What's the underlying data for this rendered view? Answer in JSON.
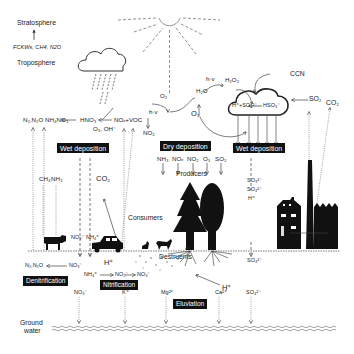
{
  "diagram": {
    "layers": {
      "stratosphere": "Stratosphere",
      "troposphere": "Troposphere",
      "ground_water": [
        "Ground",
        "water"
      ]
    },
    "gases_to_stratosphere": "FCKWs, CH4, N2O",
    "process_boxes": {
      "wet_deposition_left": "Wet deposition",
      "dry_deposition": "Dry deposition",
      "wet_deposition_right": "Wet deposition",
      "denitrification": "Denitrification",
      "nitrification": "Nitrification",
      "eluviation": "Eluviation"
    },
    "atmosphere_left": {
      "n2_n2o": "N₂,N₂O",
      "nh4no3": "NH₄NO₃",
      "hno3": "HNO₃",
      "o3_oh": "O₃, OH⁻",
      "nox_voc": "NOₓ+VOC",
      "ch4": "CH₄",
      "nh3": "NH₃",
      "co2": "CO₂"
    },
    "atmosphere_center": {
      "hv1": "h·v",
      "o2": "O₂",
      "o3": "O₃",
      "no2": "NO₂",
      "h2o": "H₂O",
      "hv2": "h·v",
      "h2o2": "H₂O₂"
    },
    "cloud_chemistry": {
      "ccn": "CCN",
      "so2": "SO₂",
      "reaction_left": "H⁺+SO₄²⁻",
      "reaction_right": "HSO₃⁻",
      "co2_factory": "CO₂"
    },
    "dry_deposition_species": [
      "NH₃",
      "NOₓ",
      "NO₂",
      "O₃",
      "SO₂"
    ],
    "right_column_ions": [
      "SO₃²⁻",
      "SO₄²⁻",
      "H⁺"
    ],
    "soil_right_ion": "SO₄²⁻",
    "labels": {
      "producers": "Producers",
      "consumers": "Consumers",
      "destruents": "Destruents",
      "h_plus_soil_left": "H⁺",
      "h_plus_soil_right": "H⁺",
      "al3_plus": "Al³⁺"
    },
    "soil_nitrogen": {
      "no3_in": "NO₃⁻",
      "nh4_in": "NH₄⁺",
      "no3_den": "NO₃⁻",
      "n2_n2o_den": "N₂,N₂O",
      "nh4_nit": "NH₄⁺",
      "no2_nit": "NO₂⁻",
      "no3_nit": "NO₃⁻"
    },
    "eluviation_ions": [
      "NO₃⁻",
      "K⁺",
      "Mg²⁺",
      "Ca²⁺",
      "SO₄²⁻"
    ]
  }
}
